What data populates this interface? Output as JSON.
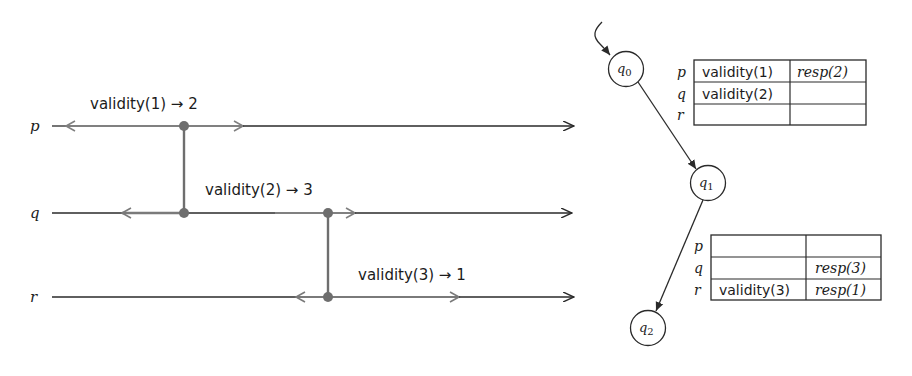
{
  "timeline": {
    "processes": [
      {
        "id": "p",
        "label": "p",
        "y": 126
      },
      {
        "id": "q",
        "label": "q",
        "y": 213
      },
      {
        "id": "r",
        "label": "r",
        "y": 297
      }
    ],
    "events": [
      {
        "label": "validity(1) → 2",
        "x": 184,
        "from": "p",
        "to": "q"
      },
      {
        "label": "validity(2) → 3",
        "x": 328,
        "from": "q",
        "to": "r"
      },
      {
        "label": "validity(3) → 1",
        "x": 328,
        "on": "r"
      }
    ]
  },
  "automaton": {
    "states": [
      {
        "id": "q0",
        "label": "q",
        "sub": "0",
        "initial": true
      },
      {
        "id": "q1",
        "label": "q",
        "sub": "1"
      },
      {
        "id": "q2",
        "label": "q",
        "sub": "2"
      }
    ],
    "transitions": [
      {
        "from": "q0",
        "to": "q1"
      },
      {
        "from": "q1",
        "to": "q2"
      }
    ]
  },
  "tables": [
    {
      "state": "q0",
      "row_labels": [
        "p",
        "q",
        "r"
      ],
      "rows": [
        [
          "validity(1)",
          "resp(2)"
        ],
        [
          "validity(2)",
          ""
        ],
        [
          "",
          ""
        ]
      ]
    },
    {
      "state": "q1",
      "row_labels": [
        "p",
        "q",
        "r"
      ],
      "rows": [
        [
          "",
          ""
        ],
        [
          "",
          "resp(3)"
        ],
        [
          "validity(3)",
          "resp(1)"
        ]
      ]
    }
  ],
  "colors": {
    "line_dark": "#2a2a2a",
    "line_grey": "#7a7a7a",
    "dot": "#6e6e6e"
  }
}
